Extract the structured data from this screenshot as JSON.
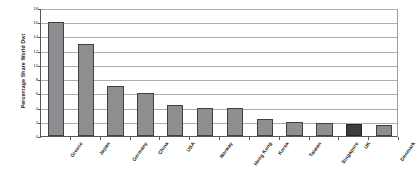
{
  "chart_data": {
    "type": "bar",
    "title": "",
    "xlabel": "",
    "ylabel": "Percentage Share World Dwt",
    "ylim": [
      0,
      18
    ],
    "ytick_values": [
      0,
      2,
      4,
      6,
      8,
      10,
      12,
      14,
      16,
      18
    ],
    "ytick_labels": [
      "0",
      "2",
      "4",
      "6",
      "8",
      "10",
      "12",
      "14",
      "16",
      "18"
    ],
    "grid": true,
    "legend": "none",
    "categories": [
      "Greece",
      "Japan",
      "Germany",
      "China",
      "USA",
      "Norway",
      "Hong Kong",
      "Korea",
      "Taiwan",
      "Singapore",
      "UK",
      "Denmark"
    ],
    "values": [
      16.0,
      13.0,
      7.0,
      6.0,
      4.3,
      4.0,
      3.9,
      2.4,
      2.0,
      1.8,
      1.7,
      1.5
    ],
    "bar_colors": [
      "#8d8f91",
      "#8d8f91",
      "#8d8f91",
      "#8d8f91",
      "#8d8f91",
      "#8d8f91",
      "#8d8f91",
      "#8d8f91",
      "#8d8f91",
      "#8d8f91",
      "#3b3d40",
      "#8d8f91"
    ],
    "highlighted_category": "UK",
    "colors": {
      "bar_fill": "#8d8f91",
      "bar_highlight": "#3b3d40",
      "bar_edge": "#3f4144",
      "gridline": "#a9aeb3",
      "axis": "#55585c",
      "background": "#ffffff",
      "text": "#1b1b1b"
    }
  }
}
